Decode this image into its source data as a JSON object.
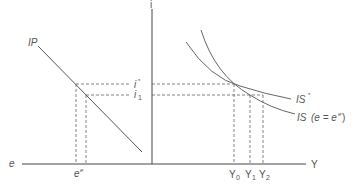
{
  "diagram": {
    "title": "",
    "colors": {
      "axis": "#444444",
      "curve": "#666666",
      "dashed": "#666666",
      "text": "#555555"
    },
    "axes": {
      "vertical_label": "i",
      "left_horizontal_label": "e",
      "right_horizontal_label": "Y"
    },
    "left_panel": {
      "curve_label": "IP",
      "x_tick_label": "e",
      "x_tick_superscript": "e"
    },
    "interest_rates": {
      "i_star_label": "i",
      "i_star_superscript": "*",
      "i_one_label": "i",
      "i_one_subscript": "1"
    },
    "right_panel": {
      "curves": [
        {
          "label": "IS*",
          "name": "IS",
          "superscript": "*"
        },
        {
          "label": "IS (e = e^e)",
          "name": "IS",
          "condition": "(e = e",
          "condition_sup": "e",
          "condition_close": ")"
        }
      ],
      "y_ticks": [
        {
          "label": "Y",
          "subscript": "0"
        },
        {
          "label": "Y",
          "subscript": "1"
        },
        {
          "label": "Y",
          "subscript": "2"
        }
      ]
    }
  }
}
